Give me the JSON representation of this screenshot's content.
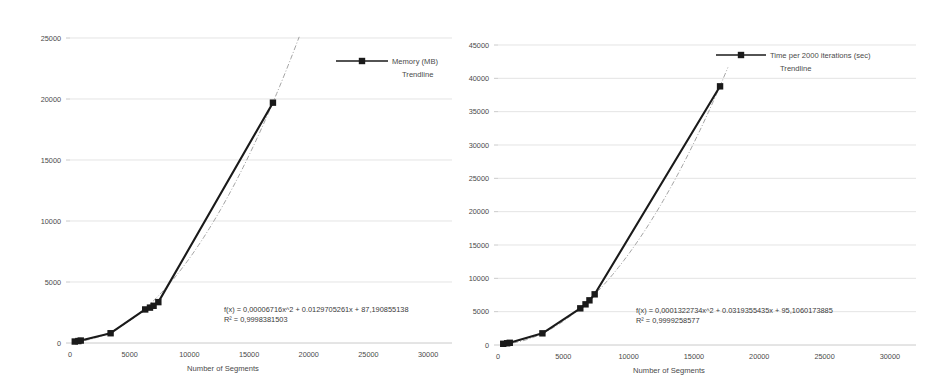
{
  "page": {
    "background_color": "#ffffff",
    "series_color": "#1a1a1a",
    "trend_color": "#9a9a9a",
    "grid_color": "#d9d9d9"
  },
  "chart_data": [
    {
      "id": "memory-chart",
      "type": "line",
      "title": "",
      "xlabel": "Number of Segments",
      "ylabel": "",
      "xlim": [
        0,
        32000
      ],
      "ylim": [
        0,
        25000
      ],
      "grid": true,
      "legend_position": "top-right",
      "xticks": [
        "0",
        "5000",
        "10000",
        "15000",
        "20000",
        "25000",
        "30000"
      ],
      "xtick_values": [
        0,
        5000,
        10000,
        15000,
        20000,
        25000,
        30000
      ],
      "yticks": [
        "0",
        "5000",
        "10000",
        "15000",
        "20000",
        "25000"
      ],
      "ytick_values": [
        0,
        5000,
        10000,
        15000,
        20000,
        25000
      ],
      "legend": [
        {
          "label": "Memory (MB)",
          "marker": "square-line"
        },
        {
          "label": "Trendline",
          "marker": "none"
        }
      ],
      "annotations": [
        "f(x) = 0,00006716x^2 + 0.0129705261x + 87,190855138",
        "R² = 0,9998381503"
      ],
      "series": [
        {
          "name": "Memory (MB)",
          "x": [
            400,
            700,
            900,
            3400,
            6300,
            6700,
            7000,
            7400,
            17000
          ],
          "y": [
            120,
            160,
            200,
            800,
            2750,
            2900,
            3050,
            3350,
            19700
          ]
        }
      ],
      "trend": {
        "name": "Trendline",
        "equation_a": 6.716e-05,
        "equation_b": 0.0129705261,
        "equation_c": 87.190855138,
        "x_start": 400,
        "x_end": 19200
      }
    },
    {
      "id": "time-chart",
      "type": "line",
      "title": "",
      "xlabel": "Number of Segments",
      "ylabel": "",
      "xlim": [
        0,
        32000
      ],
      "ylim": [
        0,
        45000
      ],
      "grid": true,
      "legend_position": "top-right",
      "xticks": [
        "0",
        "5000",
        "10000",
        "15000",
        "20000",
        "25000",
        "30000"
      ],
      "xtick_values": [
        0,
        5000,
        10000,
        15000,
        20000,
        25000,
        30000
      ],
      "yticks": [
        "0",
        "5000",
        "10000",
        "15000",
        "20000",
        "25000",
        "30000",
        "35000",
        "40000",
        "45000"
      ],
      "ytick_values": [
        0,
        5000,
        10000,
        15000,
        20000,
        25000,
        30000,
        35000,
        40000,
        45000
      ],
      "legend": [
        {
          "label": "Time per 2000 iterations (sec)",
          "marker": "square-line"
        },
        {
          "label": "Trendline",
          "marker": "none"
        }
      ],
      "annotations": [
        "f(x) = 0,0001322734x^2 + 0.0319355435x + 95,1060173885",
        "R² = 0,9999258577"
      ],
      "series": [
        {
          "name": "Time per 2000 iterations (sec)",
          "x": [
            400,
            700,
            900,
            3400,
            6300,
            6700,
            7000,
            7400,
            17000
          ],
          "y": [
            180,
            260,
            330,
            1750,
            5500,
            6100,
            6700,
            7600,
            38800
          ]
        }
      ],
      "trend": {
        "name": "Trendline",
        "equation_a": 0.0001322734,
        "equation_b": 0.0319355435,
        "equation_c": 95.1060173885,
        "x_start": 400,
        "x_end": 17600
      }
    }
  ]
}
